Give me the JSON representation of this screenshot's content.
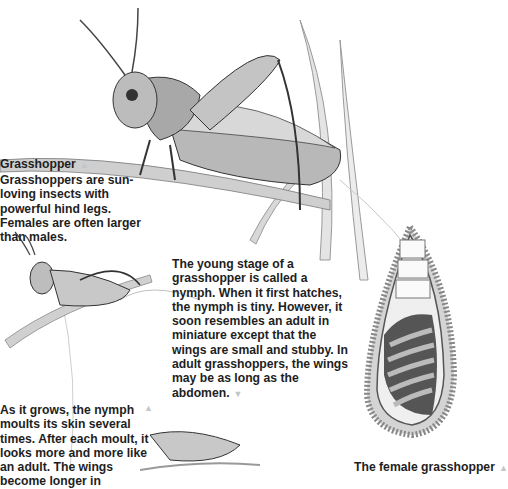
{
  "heading": {
    "title": "Grasshopper",
    "marker": "▲"
  },
  "captions": {
    "intro": "Grasshoppers are sun-loving insects with powerful hind legs. Females are often larger than males.",
    "nymph": "The young stage of a grasshopper is called a nymph. When it first hatches, the nymph is tiny. However, it soon resembles an adult in miniature except that the wings are small and stubby. In adult grasshoppers, the wings may be as long as the abdomen.",
    "nymph_marker": "▼",
    "moult": "As it grows, the nymph moults its skin several times. After each moult, it looks more and more like an adult. The wings become longer in",
    "moult_marker": "▲",
    "female": "The female grasshopper",
    "female_marker": "▲"
  },
  "illustrations": [
    {
      "name": "adult-grasshopper",
      "label": "Adult grasshopper on grass stem"
    },
    {
      "name": "nymph-grasshopper",
      "label": "Young nymph on grass"
    },
    {
      "name": "older-nymph",
      "label": "Older nymph"
    },
    {
      "name": "egg-pod",
      "label": "Egg pod in soil"
    }
  ]
}
